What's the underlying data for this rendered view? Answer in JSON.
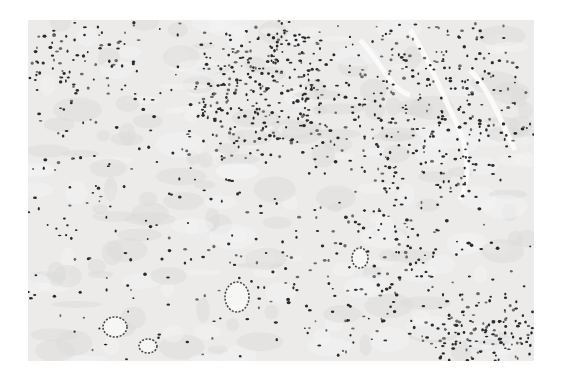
{
  "image": {
    "kind": "histology-micrograph",
    "description": "Grayscale light micrograph of tissue section showing dense lymphocytic infiltrate (upper center and lower right), loose edematous stroma on the left, vessel-like structures and small ring-shaped glands in lower area",
    "palette": {
      "background": "#ffffff",
      "stroma": "#ecebea",
      "nuclei": "#2b2b2b",
      "light_nuclei": "#6a6a6a"
    },
    "regions": [
      {
        "name": "dense-infiltrate-upper",
        "cx": 270,
        "cy": 90,
        "rx": 80,
        "ry": 70,
        "density": 0.9
      },
      {
        "name": "dense-infiltrate-lower-right",
        "cx": 480,
        "cy": 330,
        "rx": 60,
        "ry": 40,
        "density": 0.9
      },
      {
        "name": "cellular-upper-right",
        "cx": 430,
        "cy": 110,
        "rx": 100,
        "ry": 100,
        "density": 0.5
      },
      {
        "name": "cellular-upper-left",
        "cx": 80,
        "cy": 60,
        "rx": 60,
        "ry": 45,
        "density": 0.45
      },
      {
        "name": "loose-stroma-left",
        "cx": 110,
        "cy": 220,
        "rx": 90,
        "ry": 110,
        "density": 0.12
      },
      {
        "name": "stroma-center",
        "cx": 280,
        "cy": 250,
        "rx": 90,
        "ry": 80,
        "density": 0.15
      },
      {
        "name": "mixed-lower-center",
        "cx": 390,
        "cy": 260,
        "rx": 70,
        "ry": 70,
        "density": 0.4
      }
    ],
    "rings": [
      {
        "name": "gland-ring",
        "cx": 237,
        "cy": 297,
        "rx": 12,
        "ry": 15
      },
      {
        "name": "gland-ring",
        "cx": 115,
        "cy": 327,
        "rx": 12,
        "ry": 10
      },
      {
        "name": "gland-ring",
        "cx": 148,
        "cy": 346,
        "rx": 9,
        "ry": 7
      },
      {
        "name": "gland-ring",
        "cx": 360,
        "cy": 258,
        "rx": 8,
        "ry": 10
      }
    ],
    "clefts": [
      {
        "name": "vascular-cleft",
        "d": "M410,30 C430,60 440,90 455,120 C470,150 470,180 460,200"
      },
      {
        "name": "vascular-cleft",
        "d": "M470,70 C490,90 500,120 515,150"
      },
      {
        "name": "vascular-cleft",
        "d": "M360,40 C380,60 390,90 410,95"
      }
    ]
  }
}
